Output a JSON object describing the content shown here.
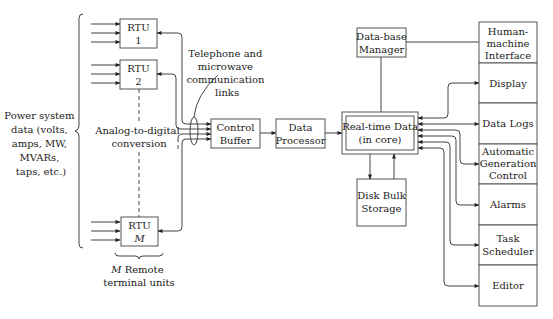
{
  "diagram": {
    "colors": {
      "line": "#444444",
      "box_stroke": "#555555",
      "text": "#222222",
      "background": "#ffffff"
    },
    "left_label": [
      "Power system",
      "data (volts,",
      "amps, MW,",
      "MVARs,",
      "taps, etc.)"
    ],
    "rtus": [
      {
        "id": "rtu1",
        "line1": "RTU",
        "line2": "1"
      },
      {
        "id": "rtu2",
        "line1": "RTU",
        "line2": "2"
      },
      {
        "id": "rtuM",
        "line1": "RTU",
        "line2": "M"
      }
    ],
    "rtu_caption": [
      "M Remote",
      "terminal units"
    ],
    "rtu_caption_italic": "M",
    "rtu_caption_rest": " Remote",
    "adc_label": [
      "Analog-to-digital",
      "conversion"
    ],
    "comm_label": [
      "Telephone and",
      "microwave",
      "communication",
      "links"
    ],
    "control_buffer": [
      "Control",
      "Buffer"
    ],
    "data_processor": [
      "Data",
      "Processor"
    ],
    "realtime_data": [
      "Real-time Data",
      "(in core)"
    ],
    "database_manager": [
      "Data-base",
      "Manager"
    ],
    "disk_storage": [
      "Disk Bulk",
      "Storage"
    ],
    "hmi_column": [
      {
        "id": "hmi",
        "lines": [
          "Human-",
          "machine",
          "Interface"
        ]
      },
      {
        "id": "display",
        "lines": [
          "Display"
        ]
      },
      {
        "id": "datalogs",
        "lines": [
          "Data Logs"
        ]
      },
      {
        "id": "agc",
        "lines": [
          "Automatic",
          "Generation",
          "Control"
        ]
      },
      {
        "id": "alarms",
        "lines": [
          "Alarms"
        ]
      },
      {
        "id": "scheduler",
        "lines": [
          "Task",
          "Scheduler"
        ]
      },
      {
        "id": "editor",
        "lines": [
          "Editor"
        ]
      }
    ]
  }
}
